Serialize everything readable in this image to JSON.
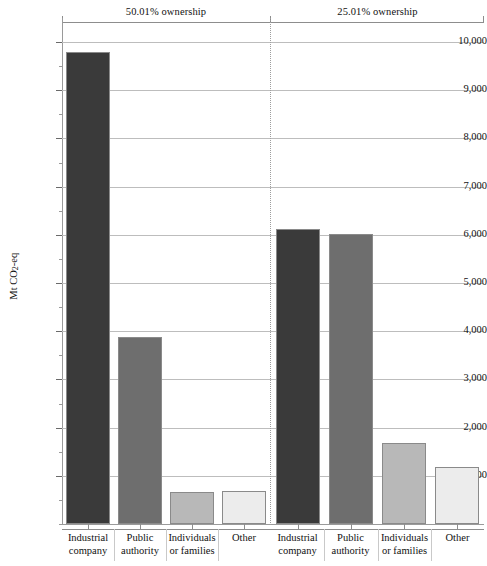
{
  "chart_data": {
    "type": "bar",
    "title": "",
    "subtitle": "",
    "xlabel": "",
    "ylabel": "Mt CO2-eq",
    "ylabel_parts": {
      "prefix": "Mt CO",
      "sub": "2",
      "suffix": "-eq"
    },
    "ylim": [
      0,
      10500
    ],
    "ytick_values": [
      1000,
      2000,
      3000,
      4000,
      5000,
      6000,
      7000,
      8000,
      9000,
      10000
    ],
    "ytick_labels": [
      "1,000",
      "2,000",
      "3,000",
      "4,000",
      "5,000",
      "6,000",
      "7,000",
      "8,000",
      "9,000",
      "10,000"
    ],
    "grid": true,
    "legend": "none",
    "categories": [
      "Industrial company",
      "Public authority",
      "Individuals or families",
      "Other"
    ],
    "category_label_lines": [
      [
        "Industrial",
        "company"
      ],
      [
        "Public",
        "authority"
      ],
      [
        "Individuals",
        "or families"
      ],
      [
        "Other",
        ""
      ]
    ],
    "panels": [
      {
        "name": "panel-50",
        "title": "50.01% ownership",
        "values": [
          9800,
          3890,
          660,
          690
        ]
      },
      {
        "name": "panel-25",
        "title": "25.01% ownership",
        "values": [
          6120,
          6010,
          1680,
          1190
        ]
      }
    ],
    "series_colors": [
      "#3a3a3a",
      "#6e6e6e",
      "#b8b8b8",
      "#ececec"
    ],
    "bar_edge_color": "#8a8a8a",
    "grid_color": "#bdbdbd",
    "axis_color": "#9a9a9a",
    "text_color": "#111111"
  }
}
